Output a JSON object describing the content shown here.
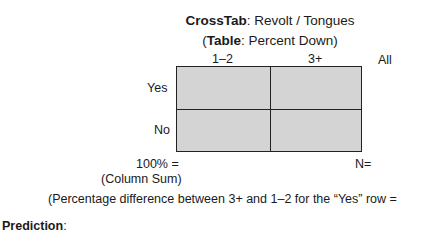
{
  "title": {
    "line1_bold": "CrossTab",
    "line1_rest": ": Revolt / Tongues",
    "line2_open": "(",
    "line2_bold": "Table",
    "line2_rest": ": Percent Down)"
  },
  "table": {
    "columns": [
      "1–2",
      "3+",
      "All"
    ],
    "rows": [
      "Yes",
      "No"
    ],
    "cells": [
      [
        "",
        ""
      ],
      [
        "",
        ""
      ]
    ],
    "total_label_line1": "100% =",
    "total_label_line2": "(Column Sum)",
    "n_label": "N="
  },
  "note": "(Percentage difference between 3+ and 1–2 for the “Yes” row =",
  "prediction": {
    "label": "Prediction",
    "colon": ":"
  }
}
